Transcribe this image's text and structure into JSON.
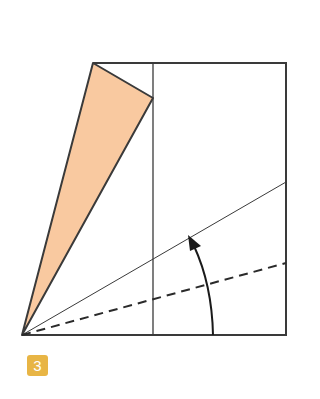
{
  "diagram": {
    "type": "origami-fold-step",
    "step_number": "3",
    "colors": {
      "paper_flap": "#f9c9a0",
      "outline": "#3a3a3a",
      "badge": "#e8b545",
      "badge_text": "#ffffff"
    },
    "elements": {
      "rectangle": "paper outline",
      "colored_flap": "folded triangular flap (orange)",
      "vertical_crease": "vertical crease line",
      "solid_fold_line": "mountain/reference fold line",
      "dashed_fold_line": "valley fold line",
      "arrow": "curved fold-direction arrow"
    }
  }
}
